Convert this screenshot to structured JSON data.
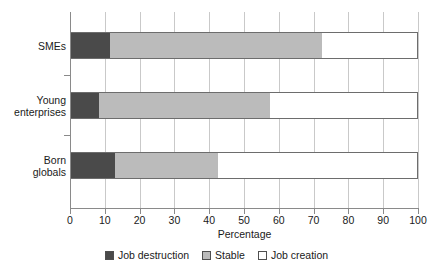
{
  "chart_data": {
    "type": "bar",
    "orientation": "horizontal",
    "stacked": true,
    "title": "",
    "xlabel": "Percentage",
    "ylabel": "",
    "xlim": [
      0,
      100
    ],
    "xticks": [
      0,
      10,
      20,
      30,
      40,
      50,
      60,
      70,
      80,
      90,
      100
    ],
    "xtick_labels": [
      "0",
      "10",
      "20",
      "30",
      "40",
      "50",
      "60",
      "70",
      "80",
      "90",
      "100"
    ],
    "grid": "vertical",
    "legend_position": "bottom",
    "categories": [
      "SMEs",
      "Young enterprises",
      "Born globals"
    ],
    "category_label_lines": [
      [
        "SMEs"
      ],
      [
        "Young",
        "enterprises"
      ],
      [
        "Born",
        "globals"
      ]
    ],
    "series": [
      {
        "name": "Job destruction",
        "color": "#4a4a4a",
        "values": [
          11.5,
          8.3,
          12.9
        ]
      },
      {
        "name": "Stable",
        "color": "#bbbbbb",
        "values": [
          60.9,
          49.2,
          29.6
        ]
      },
      {
        "name": "Job creation",
        "color": "#ffffff",
        "values": [
          27.6,
          42.5,
          57.5
        ]
      }
    ],
    "cumulative_boundaries": {
      "SMEs": [
        11.5,
        72.4,
        100
      ],
      "Young enterprises": [
        8.3,
        57.5,
        100
      ],
      "Born globals": [
        12.9,
        42.5,
        100
      ]
    }
  },
  "legend": {
    "items": [
      {
        "label": "Job destruction",
        "color": "#4a4a4a"
      },
      {
        "label": "Stable",
        "color": "#bbbbbb"
      },
      {
        "label": "Job creation",
        "color": "#ffffff"
      }
    ]
  },
  "axis": {
    "x_title": "Percentage"
  }
}
